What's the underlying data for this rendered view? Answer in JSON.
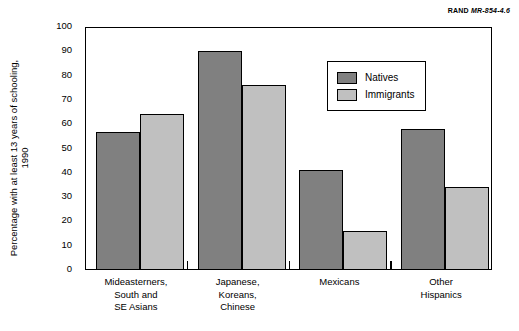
{
  "source_credit": {
    "prefix": "RAND",
    "id": "MR-854-4.6"
  },
  "chart_data": {
    "type": "bar",
    "title": "",
    "xlabel": "",
    "ylabel": "Percentage with at least 13 years of schooling,\n1990",
    "ylim": [
      0,
      100
    ],
    "ytick_labels": [
      "100",
      "90",
      "80",
      "70",
      "60",
      "50",
      "40",
      "30",
      "20",
      "10",
      "0"
    ],
    "ytick_values": [
      100,
      90,
      80,
      70,
      60,
      50,
      40,
      30,
      20,
      10,
      0
    ],
    "grid": false,
    "legend_position": "upper-right-inside",
    "categories": [
      "Mideasterners,\nSouth and\nSE Asians",
      "Japanese,\nKoreans,\nChinese",
      "Mexicans",
      "Other\nHispanics"
    ],
    "series": [
      {
        "name": "Natives",
        "color": "#808080",
        "values": [
          57,
          90,
          41,
          58
        ]
      },
      {
        "name": "Immigrants",
        "color": "#c0c0c0",
        "values": [
          64,
          76,
          16,
          34
        ]
      }
    ]
  }
}
